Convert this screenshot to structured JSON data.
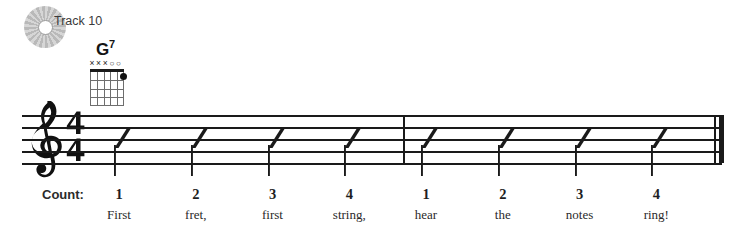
{
  "track": {
    "icon": "cd-disc-icon",
    "label": "Track 10"
  },
  "chord": {
    "name_root": "G",
    "name_suffix": "7",
    "full_name": "G7",
    "string_markers": [
      "x",
      "x",
      "x",
      "o",
      "o",
      ""
    ],
    "dots": [
      {
        "string": 6,
        "fret": 1
      }
    ],
    "num_strings": 6,
    "num_frets": 4
  },
  "staff": {
    "clef": "treble-clef",
    "time_signature": {
      "numerator": "4",
      "denominator": "4"
    },
    "measures": [
      {
        "slashes": 4
      },
      {
        "slashes": 4
      }
    ],
    "end_barline": "final-double-barline"
  },
  "count_row": {
    "label": "Count:",
    "beats": [
      "1",
      "2",
      "3",
      "4",
      "1",
      "2",
      "3",
      "4"
    ]
  },
  "lyrics": [
    "First",
    "fret,",
    "first",
    "string,",
    "hear",
    "the",
    "notes",
    "ring!"
  ],
  "colors": {
    "ink": "#1a1a1a",
    "text": "#2a2a2a",
    "grid": "#6e6e6e",
    "disc": "#c2c2c2",
    "page_bg": "#ffffff"
  }
}
